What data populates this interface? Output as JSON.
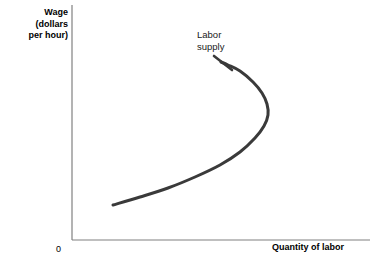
{
  "figure": {
    "background_color": "#ffffff",
    "width": 378,
    "height": 273
  },
  "axes": {
    "y_label": "Wage\n(dollars\nper hour)",
    "x_label": "Quantity of labor",
    "origin_label": "0",
    "axis_color": "#808080"
  },
  "curve": {
    "label": "Labor\nsupply",
    "color": "#3a3a3a",
    "stroke_width": 3
  },
  "chart_data": {
    "type": "line",
    "title": "",
    "xlabel": "Quantity of labor",
    "ylabel": "Wage (dollars per hour)",
    "grid": false,
    "legend_position": "inline-annotation",
    "annotations": [
      {
        "text": "Labor supply",
        "x_px": 197,
        "y_px": 29,
        "points_to_x_px": 232,
        "points_to_y_px": 70
      }
    ],
    "axis_ranges": {
      "x_axis_px": [
        72,
        370
      ],
      "y_axis_px": [
        5,
        240
      ]
    },
    "series": [
      {
        "name": "Labor supply",
        "shape": "backward-bending",
        "description": "Backward-bending labor supply curve: at low wages quantity of labor supplied rises with wage, reaches a maximum, then bends backward as higher wages reduce hours worked (income effect dominates substitution effect).",
        "points_px": [
          [
            113,
            205
          ],
          [
            140,
            197
          ],
          [
            168,
            188
          ],
          [
            195,
            177
          ],
          [
            220,
            165
          ],
          [
            240,
            152
          ],
          [
            255,
            138
          ],
          [
            264,
            126
          ],
          [
            268,
            115
          ],
          [
            267,
            104
          ],
          [
            262,
            93
          ],
          [
            253,
            82
          ],
          [
            240,
            71
          ],
          [
            228,
            65
          ],
          [
            221,
            62
          ]
        ],
        "key_points": {
          "lower_tail_start": [
            113,
            205
          ],
          "max_quantity_bend": [
            268,
            115
          ],
          "upper_tail_end": [
            221,
            62
          ]
        }
      }
    ]
  }
}
